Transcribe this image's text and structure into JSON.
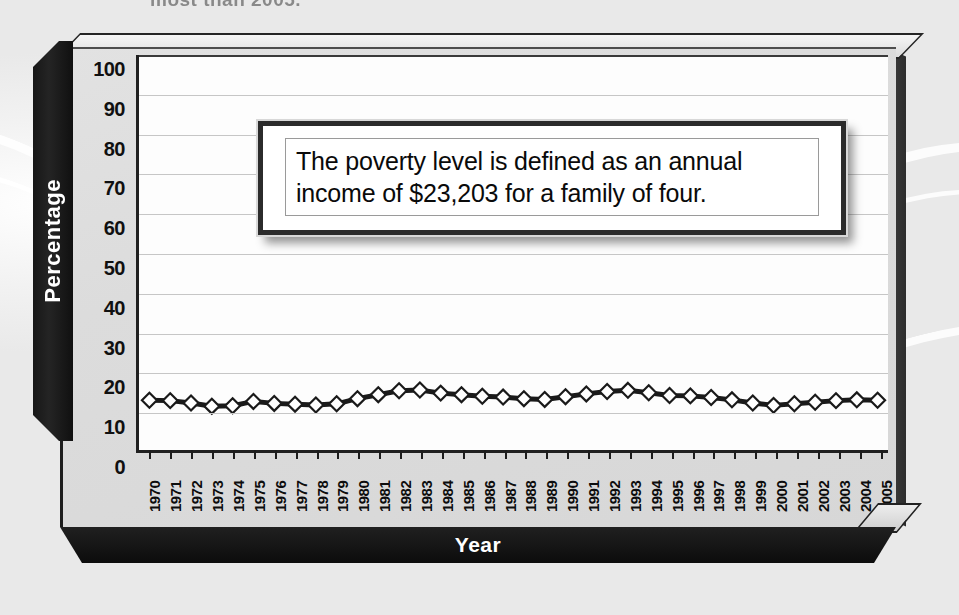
{
  "page": {
    "top_cropped_text": "most than 2005."
  },
  "callout": {
    "name": "poverty-level-note",
    "text": "The poverty level is defined as an annual income of $23,203 for a family of four."
  },
  "axis": {
    "y_title": "Percentage",
    "x_title": "Year"
  },
  "chart_data": {
    "type": "line",
    "title": "",
    "xlabel": "Year",
    "ylabel": "Percentage",
    "ylim": [
      0,
      100
    ],
    "ytick_step": 10,
    "yticks": [
      "100",
      "90",
      "80",
      "70",
      "60",
      "50",
      "40",
      "30",
      "20",
      "10",
      "0"
    ],
    "grid": true,
    "legend": "none",
    "marker": "diamond",
    "marker_fill": "#ffffff",
    "marker_edge": "#1a1a1a",
    "line_color": "#1a1a1a",
    "categories": [
      "1970",
      "1971",
      "1972",
      "1973",
      "1974",
      "1975",
      "1976",
      "1977",
      "1978",
      "1979",
      "1980",
      "1981",
      "1982",
      "1983",
      "1984",
      "1985",
      "1986",
      "1987",
      "1988",
      "1989",
      "1990",
      "1991",
      "1992",
      "1993",
      "1994",
      "1995",
      "1996",
      "1997",
      "1998",
      "1999",
      "2000",
      "2001",
      "2002",
      "2003",
      "2004",
      "2005"
    ],
    "series": [
      {
        "name": "Percentage of people below poverty level",
        "values": [
          12.6,
          12.5,
          11.9,
          11.1,
          11.2,
          12.3,
          11.8,
          11.6,
          11.4,
          11.7,
          13.0,
          14.0,
          15.0,
          15.2,
          14.4,
          14.0,
          13.6,
          13.4,
          13.0,
          12.8,
          13.5,
          14.2,
          14.8,
          15.1,
          14.5,
          13.8,
          13.7,
          13.3,
          12.7,
          11.9,
          11.3,
          11.7,
          12.1,
          12.5,
          12.7,
          12.6
        ]
      }
    ]
  }
}
